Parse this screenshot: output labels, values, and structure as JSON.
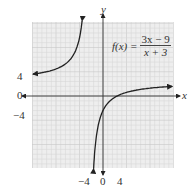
{
  "chart_data": {
    "type": "line",
    "function": {
      "lhs": "f(x) =",
      "numerator": "3x − 9",
      "denominator": "x + 3"
    },
    "xlabel": "x",
    "ylabel": "y",
    "xlim": [
      -15,
      15
    ],
    "ylim": [
      -15,
      15
    ],
    "grid": true,
    "grid_step": 1,
    "x_ticks": [
      "-4",
      "0",
      "4"
    ],
    "x_tick_values": [
      -4,
      0,
      4
    ],
    "y_ticks": [
      "4",
      "0",
      "-4"
    ],
    "y_tick_values": [
      4,
      0,
      -4
    ],
    "asymptotes": {
      "vertical": -3,
      "horizontal": 3
    },
    "series": [
      {
        "name": "left branch",
        "x_range": [
          -14.9,
          -3.6
        ],
        "points": [
          [
            -14.9,
            4.5
          ],
          [
            -10,
            5.6
          ],
          [
            -7,
            7.5
          ],
          [
            -5,
            12
          ],
          [
            -4.3,
            15.5
          ]
        ]
      },
      {
        "name": "right branch",
        "x_range": [
          -2.1,
          14.7
        ],
        "points": [
          [
            -2.1,
            -15
          ],
          [
            -1,
            -6
          ],
          [
            0,
            -3
          ],
          [
            3,
            0
          ],
          [
            6,
            1
          ],
          [
            10,
            1.6
          ],
          [
            14.7,
            2
          ]
        ]
      }
    ]
  },
  "labels": {
    "x_axis": "x",
    "y_axis": "y",
    "x_tick_neg4": "−4",
    "x_tick_0": "0",
    "x_tick_4": "4",
    "y_tick_4": "4",
    "y_tick_0": "0",
    "y_tick_neg4": "−4",
    "fn_lhs": "f(x) =",
    "fn_num": "3x − 9",
    "fn_den": "x + 3"
  }
}
